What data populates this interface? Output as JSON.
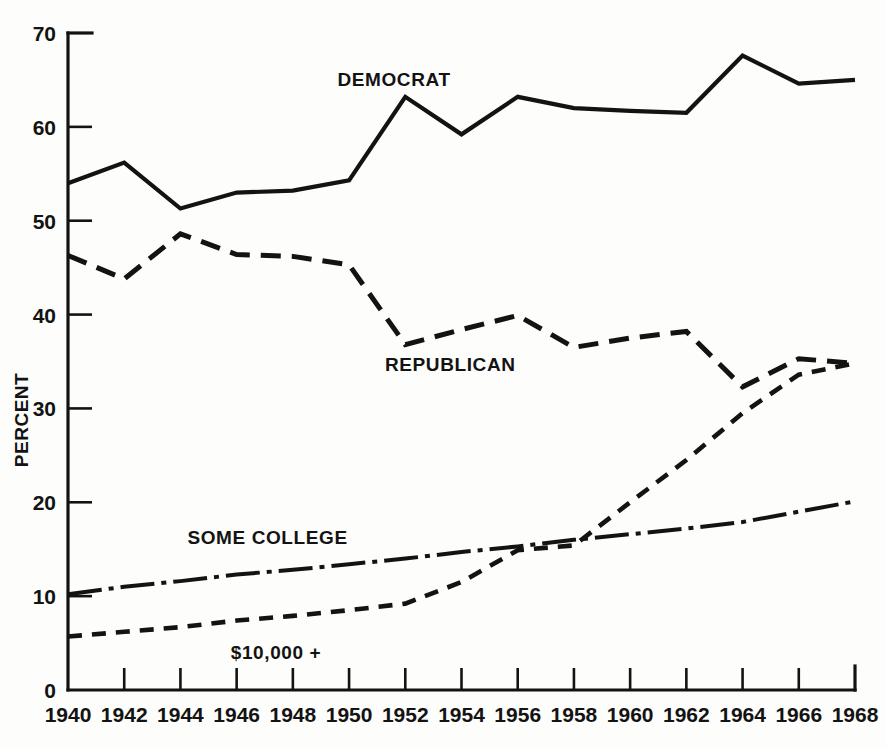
{
  "chart_data": {
    "type": "line",
    "title": "",
    "xlabel": "",
    "ylabel": "PERCENT",
    "xlim": [
      1940,
      1968
    ],
    "ylim": [
      0,
      70
    ],
    "grid": false,
    "legend_position": "inline-annotations",
    "x": [
      1940,
      1942,
      1944,
      1946,
      1948,
      1950,
      1952,
      1954,
      1956,
      1958,
      1960,
      1962,
      1964,
      1966,
      1968
    ],
    "xticklabels": [
      "1940",
      "1942",
      "1944",
      "1946",
      "1948",
      "1950",
      "1952",
      "1954",
      "1956",
      "1958",
      "1960",
      "1962",
      "1964",
      "1966",
      "1968"
    ],
    "yticks": [
      0,
      10,
      20,
      30,
      40,
      50,
      60,
      70
    ],
    "yticklabels": [
      "0",
      "10",
      "20",
      "30",
      "40",
      "50",
      "60",
      "70"
    ],
    "series": [
      {
        "name": "DEMOCRAT",
        "style": "solid",
        "color": "#131313",
        "values": [
          54.0,
          56.2,
          51.3,
          53.0,
          53.2,
          54.3,
          63.2,
          59.2,
          63.2,
          62.0,
          61.7,
          61.5,
          67.6,
          64.6,
          65.0
        ],
        "label_x": 1951.6,
        "label_y": 64.4
      },
      {
        "name": "REPUBLICAN",
        "style": "dashed-long",
        "color": "#131313",
        "values": [
          46.3,
          43.8,
          48.6,
          46.4,
          46.2,
          45.3,
          36.8,
          38.4,
          39.9,
          36.5,
          37.5,
          38.2,
          32.3,
          35.3,
          34.8
        ],
        "label_x": 1953.6,
        "label_y": 34.0
      },
      {
        "name": "SOME COLLEGE",
        "style": "dash-dot",
        "color": "#131313",
        "values": [
          10.2,
          11.0,
          11.6,
          12.3,
          12.8,
          13.4,
          14.0,
          14.7,
          15.3,
          16.0,
          16.6,
          17.2,
          17.9,
          19.0,
          20.1
        ],
        "label_x": 1947.1,
        "label_y": 15.6
      },
      {
        "name": "$10,000 +",
        "style": "dashed-short",
        "color": "#131313",
        "values": [
          5.7,
          6.2,
          6.7,
          7.4,
          7.9,
          8.5,
          9.2,
          11.5,
          14.9,
          15.4,
          20.0,
          24.5,
          29.5,
          33.6,
          34.8
        ],
        "label_x": 1947.4,
        "label_y": 3.3
      }
    ]
  }
}
